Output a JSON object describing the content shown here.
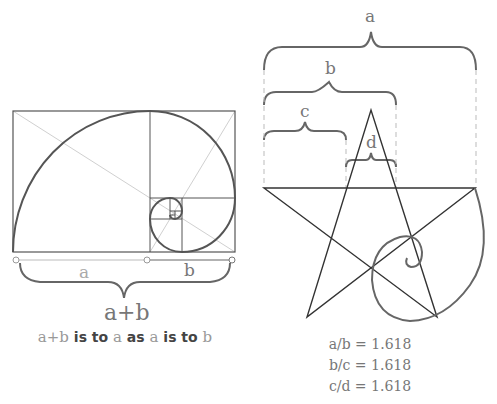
{
  "left_figure": {
    "segment_a_label": "a",
    "segment_b_label": "b",
    "total_label": "a+b",
    "caption": {
      "part1": "a+b",
      "part2": " is to ",
      "part3": "a",
      "part4": " as ",
      "part5": "a",
      "part6": " is to ",
      "part7": "b"
    }
  },
  "right_figure": {
    "brace_a_label": "a",
    "brace_b_label": "b",
    "brace_c_label": "c",
    "brace_d_label": "d",
    "ratios": [
      "a/b = 1.618",
      "b/c = 1.618",
      "c/d = 1.618"
    ]
  },
  "colors": {
    "line_dark": "#444444",
    "line_mid": "#666666",
    "line_light": "#c8c8c8",
    "text": "#777777"
  }
}
